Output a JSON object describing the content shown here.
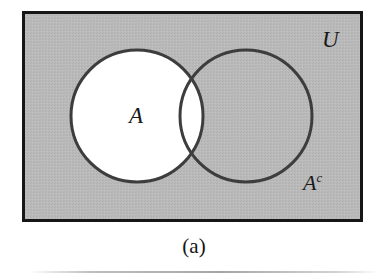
{
  "figure": {
    "caption": "(a)",
    "kind": "venn-diagram"
  },
  "labels": {
    "universe": "U",
    "set_a": "A",
    "set_a_complement_base": "A",
    "set_a_complement_superscript": "c"
  },
  "colors": {
    "universe_fill": "#b8b8b8",
    "set_a_fill": "#ffffff",
    "stroke": "#3d3d3d",
    "frame_stroke": "#161616",
    "page_background": "#ffffff",
    "text": "#1a1a1a"
  },
  "geometry": {
    "universe_rect": {
      "x": 22,
      "y": 11,
      "width": 341,
      "height": 211,
      "stroke_width": 3
    },
    "circle_a": {
      "cx": 137,
      "cy": 116,
      "r": 66,
      "stroke_width": 3
    },
    "circle_b": {
      "cx": 246,
      "cy": 116,
      "r": 66,
      "stroke_width": 3
    }
  }
}
